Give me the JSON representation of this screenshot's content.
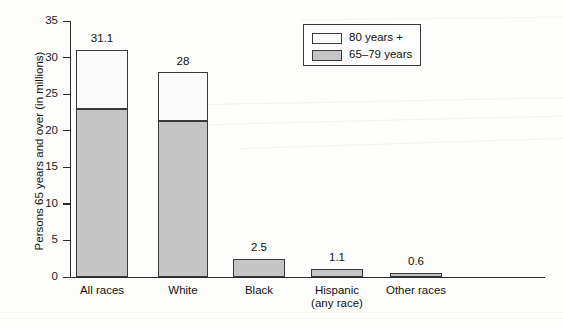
{
  "chart_data": {
    "type": "bar",
    "subtype": "stacked-vertical",
    "title": "",
    "xlabel": "",
    "ylabel": "Persons 65 years and over (in millions)",
    "ylim": [
      0,
      35
    ],
    "yticks": [
      0,
      5,
      10,
      15,
      20,
      25,
      30,
      35
    ],
    "ytick_labels": [
      "0",
      "5",
      "10",
      "15",
      "20",
      "25",
      "30",
      "35"
    ],
    "grid": false,
    "legend_position": "top-right",
    "categories": [
      "All races",
      "White",
      "Black",
      "Hispanic\n(any race)",
      "Other races"
    ],
    "category_labels": [
      {
        "line1": "All races",
        "line2": ""
      },
      {
        "line1": "White",
        "line2": ""
      },
      {
        "line1": "Black",
        "line2": ""
      },
      {
        "line1": "Hispanic",
        "line2": "(any race)"
      },
      {
        "line1": "Other races",
        "line2": ""
      }
    ],
    "series": [
      {
        "name": "65–79 years",
        "color": "#c5c5c5",
        "values": [
          23.0,
          21.3,
          2.4,
          1.1,
          0.6
        ]
      },
      {
        "name": "80 years +",
        "color": "#fafafa",
        "values": [
          8.1,
          6.7,
          0.1,
          0.0,
          0.0
        ]
      }
    ],
    "totals": [
      31.1,
      28,
      2.5,
      1.1,
      0.6
    ],
    "total_labels": [
      "31.1",
      "28",
      "2.5",
      "1.1",
      "0.6"
    ]
  },
  "legend": {
    "items": [
      {
        "label": "80 years +",
        "color": "#fafafa"
      },
      {
        "label": "65–79 years",
        "color": "#c5c5c5"
      }
    ]
  },
  "colors": {
    "series_65_79": "#c5c5c5",
    "series_80_plus": "#fafafa",
    "axis": "#2b2b2b",
    "outline": "#3a3a3a",
    "text": "#111111",
    "background": "#fdfdfb"
  }
}
